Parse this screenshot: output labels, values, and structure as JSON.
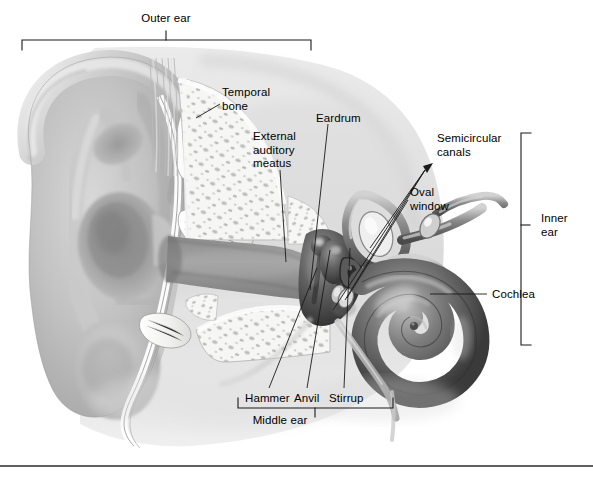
{
  "figure": {
    "type": "anatomical-illustration",
    "style": "grayscale pencil/airbrush medical illustration",
    "background_color": "#ffffff",
    "line_color": "#1a1a1a",
    "baseline_rule_color": "#2b2b2b"
  },
  "regions": {
    "outer_ear": {
      "label": "Outer ear",
      "bracket": "horizontal-top",
      "label_x": 155,
      "label_y": 17,
      "bracket_left": 22,
      "bracket_right": 311,
      "bracket_y": 40,
      "tick_x": 166
    },
    "middle_ear": {
      "label": "Middle ear",
      "bracket": "horizontal-bottom",
      "label_x": 277,
      "label_y": 421,
      "bracket_left": 238,
      "bracket_right": 393,
      "bracket_y": 408,
      "tick_x": 315
    },
    "inner_ear": {
      "label": "Inner\near",
      "bracket": "vertical-right",
      "label_x": 548,
      "label_y": 218,
      "bracket_x": 521,
      "bracket_top": 133,
      "bracket_bottom": 345,
      "tick_y": 225
    }
  },
  "labels": [
    {
      "id": "temporal-bone",
      "text": "Temporal\nbone",
      "x": 222,
      "y": 86,
      "align": "left",
      "leader": [
        [
          220,
          104
        ],
        [
          196,
          118
        ]
      ]
    },
    {
      "id": "external-auditory-meatus",
      "text": "External\nauditory\nmeatus",
      "x": 253,
      "y": 130,
      "align": "left",
      "leader": [
        [
          280,
          170
        ],
        [
          286,
          262
        ]
      ]
    },
    {
      "id": "eardrum",
      "text": "Eardrum",
      "x": 316,
      "y": 112,
      "align": "left",
      "leader": [
        [
          328,
          124
        ],
        [
          310,
          290
        ]
      ]
    },
    {
      "id": "semicircular-canals",
      "text": "Semicircular\ncanals",
      "x": 437,
      "y": 132,
      "align": "left",
      "arrow_tip": [
        425,
        168
      ],
      "leaders": [
        [
          [
            425,
            170
          ],
          [
            370,
            248
          ]
        ],
        [
          [
            425,
            170
          ],
          [
            345,
            300
          ]
        ],
        [
          [
            425,
            170
          ],
          [
            333,
            310
          ]
        ]
      ]
    },
    {
      "id": "oval-window",
      "text": "Oval\nwindow",
      "x": 410,
      "y": 186,
      "align": "left",
      "leader": [
        [
          408,
          200
        ],
        [
          347,
          298
        ]
      ]
    },
    {
      "id": "cochlea",
      "text": "Cochlea",
      "x": 492,
      "y": 288,
      "align": "left",
      "leader": [
        [
          487,
          294
        ],
        [
          430,
          294
        ]
      ]
    },
    {
      "id": "hammer",
      "text": "Hammer",
      "x": 245,
      "y": 392,
      "align": "left",
      "leader": [
        [
          269,
          388
        ],
        [
          317,
          268
        ]
      ]
    },
    {
      "id": "anvil",
      "text": "Anvil",
      "x": 294,
      "y": 392,
      "align": "left",
      "leader": [
        [
          307,
          388
        ],
        [
          330,
          250
        ]
      ]
    },
    {
      "id": "stirrup",
      "text": "Stirrup",
      "x": 329,
      "y": 392,
      "align": "left",
      "leader": [
        [
          344,
          388
        ],
        [
          350,
          248
        ]
      ]
    }
  ],
  "anatomy_parts": [
    "pinna-auricle",
    "helix",
    "antihelix",
    "concha",
    "earlobe",
    "ear-canal",
    "temporal-bone-trabecular",
    "eardrum-membrane",
    "ossicles",
    "semicircular-canals",
    "oval-window",
    "cochlea-spiral",
    "auditory-nerve",
    "eustachian-tube"
  ]
}
